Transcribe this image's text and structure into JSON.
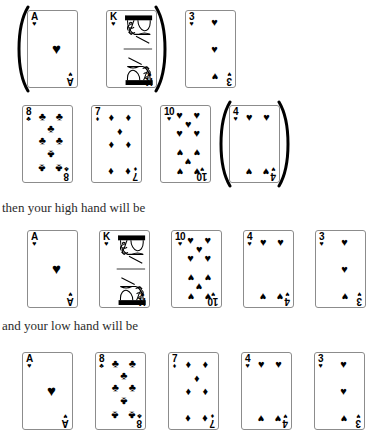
{
  "page": {
    "background": "#ffffff",
    "ink": "#000000"
  },
  "suits": {
    "hearts": "♥",
    "spades": "♠",
    "clubs": "♣",
    "diamonds": "♦"
  },
  "captions": {
    "high": "then your high hand will be",
    "low": "and your low hand will be"
  },
  "rows": [
    {
      "name": "dealt-hand-row-1",
      "top": 10,
      "left": 27,
      "gap": 28,
      "cards": [
        {
          "rank": "A",
          "suit": "hearts",
          "suit_symbol": "♥",
          "label": "ace-of-hearts",
          "arc_left": true,
          "arc_right": false,
          "face": false
        },
        {
          "rank": "K",
          "suit": "hearts",
          "suit_symbol": "♥",
          "label": "king-of-hearts",
          "arc_left": false,
          "arc_right": true,
          "face": true
        },
        {
          "rank": "3",
          "suit": "hearts",
          "suit_symbol": "♥",
          "label": "three-of-hearts",
          "arc_left": false,
          "arc_right": false,
          "face": false
        }
      ]
    },
    {
      "name": "dealt-hand-row-2",
      "top": 105,
      "left": 22,
      "gap": 18,
      "cards": [
        {
          "rank": "8",
          "suit": "clubs",
          "suit_symbol": "♣",
          "label": "eight-of-clubs",
          "arc_left": false,
          "arc_right": false,
          "face": false
        },
        {
          "rank": "7",
          "suit": "diamonds",
          "suit_symbol": "♦",
          "label": "seven-of-diamonds",
          "arc_left": false,
          "arc_right": false,
          "face": false
        },
        {
          "rank": "10",
          "suit": "hearts",
          "suit_symbol": "♥",
          "label": "ten-of-hearts",
          "arc_left": false,
          "arc_right": false,
          "face": false
        },
        {
          "rank": "4",
          "suit": "hearts",
          "suit_symbol": "♥",
          "label": "four-of-hearts",
          "arc_left": true,
          "arc_right": true,
          "face": false
        }
      ]
    },
    {
      "name": "high-hand-row",
      "top": 230,
      "left": 27,
      "gap": 21,
      "cards": [
        {
          "rank": "A",
          "suit": "hearts",
          "suit_symbol": "♥",
          "label": "ace-of-hearts",
          "arc_left": false,
          "arc_right": false,
          "face": false
        },
        {
          "rank": "K",
          "suit": "hearts",
          "suit_symbol": "♥",
          "label": "king-of-hearts",
          "arc_left": false,
          "arc_right": false,
          "face": true
        },
        {
          "rank": "10",
          "suit": "hearts",
          "suit_symbol": "♥",
          "label": "ten-of-hearts",
          "arc_left": false,
          "arc_right": false,
          "face": false
        },
        {
          "rank": "4",
          "suit": "hearts",
          "suit_symbol": "♥",
          "label": "four-of-hearts",
          "arc_left": false,
          "arc_right": false,
          "face": false
        },
        {
          "rank": "3",
          "suit": "hearts",
          "suit_symbol": "♥",
          "label": "three-of-hearts",
          "arc_left": false,
          "arc_right": false,
          "face": false
        }
      ]
    },
    {
      "name": "low-hand-row",
      "top": 352,
      "left": 22,
      "gap": 22,
      "cards": [
        {
          "rank": "A",
          "suit": "hearts",
          "suit_symbol": "♥",
          "label": "ace-of-hearts",
          "arc_left": false,
          "arc_right": false,
          "face": false
        },
        {
          "rank": "8",
          "suit": "clubs",
          "suit_symbol": "♣",
          "label": "eight-of-clubs",
          "arc_left": false,
          "arc_right": false,
          "face": false
        },
        {
          "rank": "7",
          "suit": "diamonds",
          "suit_symbol": "♦",
          "label": "seven-of-diamonds",
          "arc_left": false,
          "arc_right": false,
          "face": false
        },
        {
          "rank": "4",
          "suit": "hearts",
          "suit_symbol": "♥",
          "label": "four-of-hearts",
          "arc_left": false,
          "arc_right": false,
          "face": false
        },
        {
          "rank": "3",
          "suit": "hearts",
          "suit_symbol": "♥",
          "label": "three-of-hearts",
          "arc_left": false,
          "arc_right": false,
          "face": false
        }
      ]
    }
  ],
  "caption_positions": {
    "high_top": 200,
    "low_top": 318
  },
  "pip_layouts": {
    "A": [
      {
        "x": 50,
        "y": 50,
        "flip": false,
        "big": true
      }
    ],
    "3": [
      {
        "x": 50,
        "y": 12,
        "flip": false
      },
      {
        "x": 50,
        "y": 50,
        "flip": false
      },
      {
        "x": 50,
        "y": 88,
        "flip": true
      }
    ],
    "4": [
      {
        "x": 22,
        "y": 12,
        "flip": false
      },
      {
        "x": 74,
        "y": 12,
        "flip": false
      },
      {
        "x": 22,
        "y": 88,
        "flip": true
      },
      {
        "x": 74,
        "y": 88,
        "flip": true
      }
    ],
    "7": [
      {
        "x": 22,
        "y": 12,
        "flip": false
      },
      {
        "x": 74,
        "y": 12,
        "flip": false
      },
      {
        "x": 48,
        "y": 31,
        "flip": false
      },
      {
        "x": 22,
        "y": 50,
        "flip": false
      },
      {
        "x": 74,
        "y": 50,
        "flip": false
      },
      {
        "x": 22,
        "y": 88,
        "flip": true
      },
      {
        "x": 74,
        "y": 88,
        "flip": true
      }
    ],
    "8": [
      {
        "x": 22,
        "y": 10,
        "flip": false
      },
      {
        "x": 74,
        "y": 10,
        "flip": false
      },
      {
        "x": 48,
        "y": 27,
        "flip": false
      },
      {
        "x": 22,
        "y": 44,
        "flip": false
      },
      {
        "x": 74,
        "y": 44,
        "flip": false
      },
      {
        "x": 48,
        "y": 64,
        "flip": true
      },
      {
        "x": 22,
        "y": 84,
        "flip": true
      },
      {
        "x": 74,
        "y": 84,
        "flip": true
      }
    ],
    "10": [
      {
        "x": 20,
        "y": 9,
        "flip": false
      },
      {
        "x": 72,
        "y": 9,
        "flip": false
      },
      {
        "x": 46,
        "y": 22,
        "flip": false
      },
      {
        "x": 20,
        "y": 34,
        "flip": false
      },
      {
        "x": 72,
        "y": 34,
        "flip": false
      },
      {
        "x": 20,
        "y": 62,
        "flip": true
      },
      {
        "x": 72,
        "y": 62,
        "flip": true
      },
      {
        "x": 46,
        "y": 74,
        "flip": true
      },
      {
        "x": 20,
        "y": 88,
        "flip": true
      },
      {
        "x": 72,
        "y": 88,
        "flip": true
      }
    ]
  }
}
